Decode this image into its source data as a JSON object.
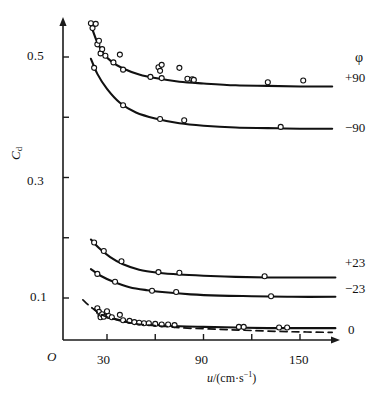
{
  "axes": {
    "y_title": "C",
    "y_title_sub": "d",
    "x_title_prefix": "u",
    "x_title_body": "/(cm·s",
    "x_title_sup": "−1",
    "x_title_suffix": ")",
    "origin_label": "O",
    "y_ticks": [
      {
        "value": 0.5,
        "label": "0.5"
      },
      {
        "value": 0.4,
        "label": ""
      },
      {
        "value": 0.3,
        "label": "0.3"
      },
      {
        "value": 0.2,
        "label": ""
      },
      {
        "value": 0.1,
        "label": "0.1"
      }
    ],
    "x_ticks": [
      {
        "value": 30,
        "label": "30"
      },
      {
        "value": 60,
        "label": ""
      },
      {
        "value": 90,
        "label": "90"
      },
      {
        "value": 120,
        "label": ""
      },
      {
        "value": 150,
        "label": "150"
      }
    ],
    "xlim": [
      0,
      195
    ],
    "ylim": [
      0.0,
      0.58
    ]
  },
  "legend": {
    "header": "φ",
    "items": [
      {
        "label": "+90"
      },
      {
        "label": "−90"
      },
      {
        "label": "+23"
      },
      {
        "label": "−23"
      },
      {
        "label": "0"
      }
    ]
  },
  "caption": "",
  "chart_data": {
    "type": "scatter",
    "title": "",
    "xlabel": "u/(cm·s⁻¹)",
    "ylabel": "C_d",
    "xlim": [
      0,
      195
    ],
    "ylim": [
      0,
      0.58
    ],
    "grid": false,
    "legend_position": "right",
    "legend_title": "φ",
    "marker": "open-circle",
    "series": [
      {
        "name": "+90",
        "label": "+90",
        "line": "solid",
        "curve": [
          [
            20,
            0.553
          ],
          [
            24,
            0.524
          ],
          [
            28,
            0.505
          ],
          [
            33,
            0.492
          ],
          [
            40,
            0.481
          ],
          [
            50,
            0.471
          ],
          [
            60,
            0.465
          ],
          [
            75,
            0.459
          ],
          [
            90,
            0.456
          ],
          [
            110,
            0.453
          ],
          [
            130,
            0.452
          ],
          [
            150,
            0.451
          ],
          [
            170,
            0.451
          ]
        ],
        "points": [
          [
            20,
            0.556
          ],
          [
            21,
            0.548
          ],
          [
            23,
            0.555
          ],
          [
            24,
            0.521
          ],
          [
            25,
            0.527
          ],
          [
            26,
            0.506
          ],
          [
            27,
            0.513
          ],
          [
            29,
            0.502
          ],
          [
            34,
            0.491
          ],
          [
            38,
            0.504
          ],
          [
            40,
            0.479
          ],
          [
            62,
            0.483
          ],
          [
            63,
            0.477
          ],
          [
            64,
            0.487
          ],
          [
            64,
            0.465
          ],
          [
            57,
            0.467
          ],
          [
            75,
            0.482
          ],
          [
            80,
            0.464
          ],
          [
            83,
            0.463
          ],
          [
            84,
            0.462
          ],
          [
            130,
            0.458
          ],
          [
            152,
            0.461
          ]
        ]
      },
      {
        "name": "-90",
        "label": "−90",
        "line": "solid",
        "curve": [
          [
            20,
            0.497
          ],
          [
            24,
            0.472
          ],
          [
            30,
            0.447
          ],
          [
            38,
            0.424
          ],
          [
            48,
            0.408
          ],
          [
            60,
            0.398
          ],
          [
            75,
            0.39
          ],
          [
            90,
            0.386
          ],
          [
            110,
            0.383
          ],
          [
            130,
            0.382
          ],
          [
            150,
            0.381
          ],
          [
            170,
            0.381
          ]
        ],
        "points": [
          [
            22,
            0.482
          ],
          [
            40,
            0.42
          ],
          [
            63,
            0.397
          ],
          [
            78,
            0.395
          ],
          [
            138,
            0.384
          ]
        ]
      },
      {
        "name": "+23",
        "label": "+23",
        "line": "solid",
        "curve": [
          [
            20,
            0.197
          ],
          [
            25,
            0.183
          ],
          [
            32,
            0.168
          ],
          [
            40,
            0.156
          ],
          [
            50,
            0.147
          ],
          [
            62,
            0.142
          ],
          [
            75,
            0.139
          ],
          [
            90,
            0.137
          ],
          [
            110,
            0.135
          ],
          [
            130,
            0.134
          ],
          [
            150,
            0.134
          ],
          [
            172,
            0.134
          ]
        ],
        "points": [
          [
            22,
            0.192
          ],
          [
            28,
            0.178
          ],
          [
            39,
            0.161
          ],
          [
            62,
            0.143
          ],
          [
            75,
            0.142
          ],
          [
            128,
            0.136
          ]
        ]
      },
      {
        "name": "-23",
        "label": "−23",
        "line": "solid",
        "curve": [
          [
            20,
            0.148
          ],
          [
            26,
            0.137
          ],
          [
            34,
            0.127
          ],
          [
            44,
            0.118
          ],
          [
            55,
            0.113
          ],
          [
            68,
            0.109
          ],
          [
            82,
            0.106
          ],
          [
            100,
            0.104
          ],
          [
            120,
            0.103
          ],
          [
            145,
            0.102
          ],
          [
            172,
            0.102
          ]
        ],
        "points": [
          [
            24,
            0.14
          ],
          [
            35,
            0.127
          ],
          [
            58,
            0.112
          ],
          [
            73,
            0.11
          ],
          [
            132,
            0.103
          ]
        ]
      },
      {
        "name": "0-solid",
        "label": "0",
        "line": "solid",
        "curve": [
          [
            22,
            0.082
          ],
          [
            26,
            0.074
          ],
          [
            31,
            0.069
          ],
          [
            37,
            0.064
          ],
          [
            44,
            0.06
          ],
          [
            52,
            0.057
          ],
          [
            62,
            0.055
          ],
          [
            75,
            0.053
          ],
          [
            90,
            0.052
          ],
          [
            110,
            0.051
          ],
          [
            130,
            0.05
          ],
          [
            150,
            0.05
          ],
          [
            172,
            0.05
          ]
        ],
        "points": [
          [
            24,
            0.083
          ],
          [
            25,
            0.077
          ],
          [
            26,
            0.071
          ],
          [
            26,
            0.068
          ],
          [
            27,
            0.073
          ],
          [
            28,
            0.069
          ],
          [
            30,
            0.078
          ],
          [
            31,
            0.07
          ],
          [
            33,
            0.068
          ],
          [
            38,
            0.072
          ],
          [
            40,
            0.063
          ],
          [
            44,
            0.062
          ],
          [
            47,
            0.06
          ],
          [
            50,
            0.059
          ],
          [
            53,
            0.058
          ],
          [
            56,
            0.058
          ],
          [
            60,
            0.057
          ],
          [
            64,
            0.056
          ],
          [
            68,
            0.056
          ],
          [
            72,
            0.055
          ],
          [
            112,
            0.052
          ],
          [
            115,
            0.052
          ],
          [
            137,
            0.051
          ],
          [
            142,
            0.051
          ]
        ]
      },
      {
        "name": "0-dashed",
        "label": "",
        "line": "dashed",
        "curve": [
          [
            15,
            0.097
          ],
          [
            20,
            0.085
          ],
          [
            26,
            0.073
          ],
          [
            33,
            0.066
          ],
          [
            42,
            0.06
          ],
          [
            52,
            0.056
          ],
          [
            65,
            0.053
          ],
          [
            80,
            0.05
          ],
          [
            100,
            0.048
          ],
          [
            120,
            0.046
          ],
          [
            145,
            0.044
          ],
          [
            170,
            0.043
          ]
        ],
        "points": []
      }
    ]
  }
}
